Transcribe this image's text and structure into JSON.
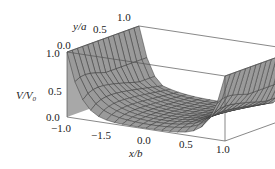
{
  "chart_data": {
    "type": "surface3d",
    "title": "",
    "xlabel": "x/b",
    "ylabel": "y/a",
    "zlabel": "V/V0",
    "x_ticks": [
      "−1.0",
      "−1.5",
      "0.0",
      "0.5",
      "1.0"
    ],
    "y_ticks": [
      "0.0",
      "0.5",
      "1.0"
    ],
    "z_ticks": [
      "0.0",
      "0.5",
      "1.0"
    ],
    "xlim": [
      -1.0,
      1.0
    ],
    "ylim": [
      0.0,
      1.0
    ],
    "zlim": [
      0.0,
      1.0
    ],
    "grid": false,
    "surface_description": "Potential V/V0 in a rectangular trough: equals 1.0 along the boundaries x/b = -1 and x/b = 1 (side walls), falls to a U-shaped minimum near the centre, with mesh lines drawn on a grey surface.",
    "boundary_values": {
      "x_minus_1": 1.0,
      "x_plus_1": 1.0,
      "center_min_at_y0": 0.0
    },
    "colors": {
      "surface": "#9a9a9a",
      "mesh": "#3a3a3a",
      "box": "#555555"
    }
  },
  "labels": {
    "y_axis": "y/a",
    "y_ticks": [
      "0.0",
      "0.5",
      "1.0"
    ],
    "z_axis_main": "V/V",
    "z_axis_sub": "0",
    "z_ticks": [
      "1.0",
      "0.5",
      "0.0"
    ],
    "x_axis": "x/b",
    "x_ticks": [
      "−1.0",
      "−1.5",
      "0.0",
      "0.5",
      "1.0"
    ]
  }
}
